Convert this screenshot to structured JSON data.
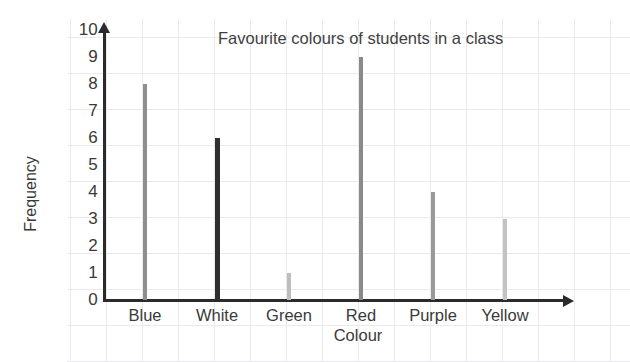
{
  "chart_data": {
    "type": "bar",
    "title": "Favourite colours of students in a class",
    "xlabel": "Colour",
    "ylabel": "Frequency",
    "categories": [
      "Blue",
      "White",
      "Green",
      "Red",
      "Purple",
      "Yellow"
    ],
    "values": [
      8,
      6,
      1,
      9,
      4,
      3
    ],
    "ylim": [
      0,
      10
    ],
    "yticks": [
      "10",
      "9",
      "8",
      "7",
      "6",
      "5",
      "4",
      "3",
      "2",
      "1",
      "0"
    ],
    "grid": "light graph-paper background grid",
    "legend": "none",
    "bar_colors": [
      "#8f8f8f",
      "#2f2f2f",
      "#bdbdbd",
      "#8a8a8a",
      "#9a9a9a",
      "#c2c2c2"
    ],
    "series": [
      {
        "name": "Frequency",
        "points": [
          {
            "category": "Blue",
            "value": 8,
            "color": "#8f8f8f"
          },
          {
            "category": "White",
            "value": 6,
            "color": "#2f2f2f"
          },
          {
            "category": "Green",
            "value": 1,
            "color": "#bdbdbd"
          },
          {
            "category": "Red",
            "value": 9,
            "color": "#8a8a8a"
          },
          {
            "category": "Purple",
            "value": 4,
            "color": "#9a9a9a"
          },
          {
            "category": "Yellow",
            "value": 3,
            "color": "#c2c2c2"
          }
        ]
      }
    ]
  },
  "style": {
    "axis_color": "#2b2b2b",
    "text_color": "#3a3a3a",
    "grid_color": "#e9e9ee",
    "background": "#ffffff"
  }
}
